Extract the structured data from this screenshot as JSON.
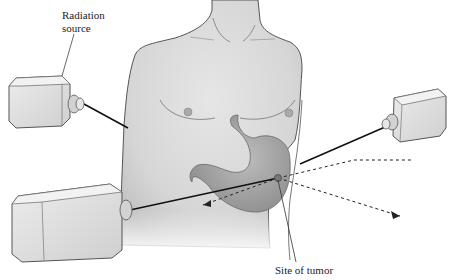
{
  "labels": {
    "radiation_source_line1": "Radiation",
    "radiation_source_line2": "source",
    "site_of_tumor": "Site of tumor"
  },
  "colors": {
    "skin": "#dcdcdc",
    "skin_shadow": "#bdbdbd",
    "outline": "#555555",
    "stomach": "#a9a9a9",
    "beam": "#111111",
    "device": "#e3e3e3"
  },
  "elements": {
    "sources": [
      {
        "id": "source-upper-left",
        "position": "left shoulder"
      },
      {
        "id": "source-right",
        "position": "right side"
      },
      {
        "id": "source-lower-left",
        "position": "lower left"
      }
    ],
    "beams_converge_on": "tumor",
    "exit_beams": "dashed arrows"
  }
}
